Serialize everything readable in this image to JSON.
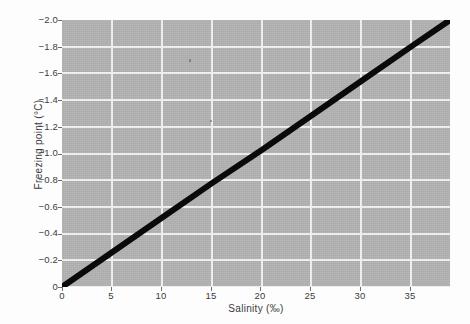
{
  "chart_data": {
    "type": "line",
    "title": "",
    "xlabel": "Salinity (‰)",
    "ylabel": "Freezing point (°C)",
    "xlim": [
      0,
      38.7
    ],
    "ylim": [
      -2.0,
      0
    ],
    "grid": true,
    "legend": "none",
    "xticks": [
      0,
      5,
      10,
      15,
      20,
      25,
      30,
      35
    ],
    "xticklabels": [
      "0",
      "5",
      "10",
      "15",
      "20",
      "25",
      "30",
      "35"
    ],
    "yticks": [
      -2.0,
      -1.8,
      -1.6,
      -1.4,
      -1.2,
      -1.0,
      -0.8,
      -0.6,
      -0.4,
      -0.2,
      0
    ],
    "yticklabels": [
      "−2.0",
      "−1.8",
      "−1.6",
      "−1.4",
      "−1.2",
      "−1.0",
      "−0.8",
      "−0.6",
      "−0.4",
      "−0.2",
      "0"
    ],
    "series": [
      {
        "name": "Freezing point of seawater",
        "x": [
          0,
          5,
          10,
          15,
          20,
          25,
          30,
          35,
          38.7
        ],
        "values": [
          0,
          -0.26,
          -0.52,
          -0.78,
          -1.03,
          -1.29,
          -1.55,
          -1.81,
          -2.0
        ],
        "color": "#0a0a0a",
        "linewidth": 6
      }
    ]
  },
  "style": {
    "plot_background": "#b2b2b2",
    "grid_color": "#f2f2f2",
    "figure_background": "#fdfdfd",
    "text_color": "#3b3b3b",
    "line_color": "#0a0a0a"
  }
}
